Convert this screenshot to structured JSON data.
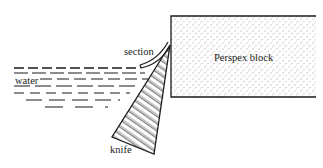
{
  "diagram": {
    "type": "microtome-sectioning-schematic",
    "labels": {
      "section": "section",
      "block": "Perspex block",
      "water": "water",
      "knife": "knife"
    },
    "colors": {
      "ink": "#1a1a1a",
      "background": "#ffffff"
    }
  }
}
